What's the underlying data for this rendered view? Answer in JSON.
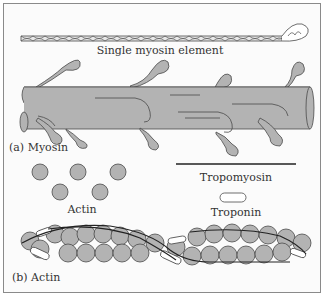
{
  "figure": {
    "colors": {
      "fill": "#b3b3b3",
      "stroke": "#4a4a4a",
      "background": "#fbfbfb",
      "border": "#8a8a8a",
      "troponin_fill": "#ffffff"
    },
    "labels": {
      "single_myosin": "Single myosin element",
      "panel_a": "(a) Myosin",
      "actin_legend": "Actin",
      "tropomyosin_legend": "Tropomyosin",
      "troponin_legend": "Troponin",
      "panel_b": "(b) Actin"
    }
  }
}
